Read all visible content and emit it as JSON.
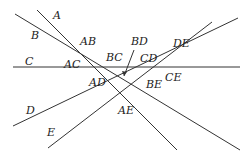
{
  "diagram": {
    "lines": [
      {
        "name": "A",
        "x1": 37,
        "y1": 10,
        "x2": 177,
        "y2": 150
      },
      {
        "name": "B",
        "x1": 15,
        "y1": 14,
        "x2": 240,
        "y2": 150
      },
      {
        "name": "C",
        "x1": 13,
        "y1": 67,
        "x2": 240,
        "y2": 67
      },
      {
        "name": "D",
        "x1": 13,
        "y1": 126,
        "x2": 238,
        "y2": 18
      },
      {
        "name": "E",
        "x1": 48,
        "y1": 148,
        "x2": 212,
        "y2": 22
      }
    ],
    "labels": [
      {
        "text": "A",
        "x": 53,
        "y": 19
      },
      {
        "text": "B",
        "x": 31,
        "y": 39
      },
      {
        "text": "C",
        "x": 25,
        "y": 65
      },
      {
        "text": "D",
        "x": 26,
        "y": 114
      },
      {
        "text": "E",
        "x": 47,
        "y": 136
      },
      {
        "text": "AB",
        "x": 80,
        "y": 45
      },
      {
        "text": "AC",
        "x": 64,
        "y": 68
      },
      {
        "text": "BC",
        "x": 106,
        "y": 61
      },
      {
        "text": "BD",
        "x": 131,
        "y": 45
      },
      {
        "text": "CD",
        "x": 140,
        "y": 62
      },
      {
        "text": "DE",
        "x": 173,
        "y": 47
      },
      {
        "text": "AD",
        "x": 89,
        "y": 86
      },
      {
        "text": "BE",
        "x": 146,
        "y": 88
      },
      {
        "text": "CE",
        "x": 165,
        "y": 81
      },
      {
        "text": "AE",
        "x": 118,
        "y": 114
      }
    ],
    "arrow": {
      "x1": 134,
      "y1": 50,
      "x2": 124,
      "y2": 76
    }
  }
}
